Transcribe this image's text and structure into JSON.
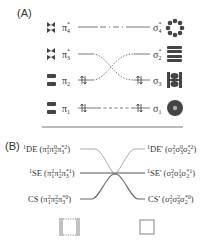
{
  "panel_a": {
    "label": "(A)",
    "left_orbitals": [
      {
        "symbol": "π",
        "sub": "4",
        "sup": "*",
        "y": 27,
        "occupancy": 0,
        "icon": "cyclobutadiene-pi4-orbital-icon"
      },
      {
        "symbol": "π",
        "sub": "3",
        "sup": "*",
        "y": 54,
        "occupancy": 0,
        "icon": "cyclobutadiene-pi3-orbital-icon"
      },
      {
        "symbol": "π",
        "sub": "2",
        "sup": "",
        "y": 80,
        "occupancy": 2,
        "icon": "cyclobutadiene-pi2-orbital-icon"
      },
      {
        "symbol": "π",
        "sub": "1",
        "sup": "",
        "y": 108,
        "occupancy": 2,
        "icon": "cyclobutadiene-pi1-orbital-icon"
      }
    ],
    "right_orbitals": [
      {
        "symbol": "σ",
        "sub": "4",
        "sup": "*",
        "y": 27,
        "occupancy": 0,
        "icon": "sigma4-orbital-icon"
      },
      {
        "symbol": "σ",
        "sub": "2",
        "sup": "*",
        "y": 54,
        "occupancy": 0,
        "icon": "sigma2-orbital-icon"
      },
      {
        "symbol": "σ",
        "sub": "3",
        "sup": "",
        "y": 80,
        "occupancy": 2,
        "icon": "sigma3-orbital-icon"
      },
      {
        "symbol": "σ",
        "sub": "1",
        "sup": "",
        "y": 108,
        "occupancy": 2,
        "icon": "sigma1-orbital-icon"
      }
    ],
    "correlations": [
      {
        "from": "π4*",
        "to": "σ4*",
        "style": "dash-dot"
      },
      {
        "from": "π3*",
        "to": "σ3",
        "style": "dotted"
      },
      {
        "from": "π2",
        "to": "σ2*",
        "style": "dotted"
      },
      {
        "from": "π1",
        "to": "σ1",
        "style": "dashed"
      }
    ]
  },
  "panel_b": {
    "label": "(B)",
    "left_states": [
      {
        "prefix": "1",
        "name": "DE",
        "config": "(π1²π2⁰π3*²)",
        "y": 149,
        "color": "#aaaaaa"
      },
      {
        "prefix": "1",
        "name": "SE",
        "config": "(π1²π2¹π3*¹)",
        "y": 173,
        "color": "#555555"
      },
      {
        "prefix": "",
        "name": "CS",
        "config": "(π1²π2²π3*⁰)",
        "y": 199,
        "color": "#666666"
      }
    ],
    "right_states": [
      {
        "prefix": "1",
        "name": "DE'",
        "config": "(σ1²σ3⁰σ2*²)",
        "y": 149,
        "color": "#aaaaaa"
      },
      {
        "prefix": "1",
        "name": "SE'",
        "config": "(σ1²σ3¹σ2*¹)",
        "y": 173,
        "color": "#555555"
      },
      {
        "prefix": "",
        "name": "CS'",
        "config": "(σ1²σ3²σ2*⁰)",
        "y": 199,
        "color": "#666666"
      }
    ],
    "bottom_icons": {
      "left": "two-ethylene-molecules-icon",
      "right": "cyclobutane-square-icon"
    }
  },
  "colors": {
    "text": "#333333",
    "orbital_fill": "#444444",
    "line_dark": "#555555",
    "line_light": "#aaaaaa"
  }
}
